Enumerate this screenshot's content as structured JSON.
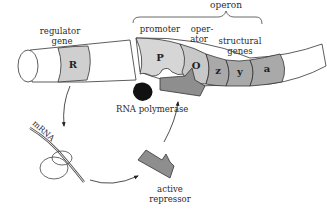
{
  "labels": {
    "operon": "operon",
    "regulator_gene": [
      "regulator",
      "gene"
    ],
    "promoter": "promoter",
    "operator": [
      "oper-",
      "ator"
    ],
    "structural_genes": [
      "structural",
      "genes"
    ],
    "rna_polymerase": "RNA polymerase",
    "mrna": "mRNA",
    "active_repressor": [
      "active",
      "repressor"
    ]
  },
  "genes": {
    "regulator": "R",
    "promoter": "P",
    "operator": "O",
    "structural": [
      "z",
      "y",
      "a"
    ]
  },
  "colors": {
    "dna_fill": "#ffffff",
    "regulator_fill": "#cfcfcf",
    "promoter_fill": "#d6d6d6",
    "operator_fill": "#c8c8c8",
    "structural_fill": "#a9a9a9",
    "repressor_fill": "#8e8e8e",
    "polymerase_fill": "#111111",
    "stroke": "#333333"
  }
}
